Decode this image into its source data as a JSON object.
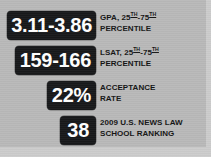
{
  "panel": {
    "background_color": "#b9b9b9",
    "badge_color": "#17181a",
    "badge_text_color": "#ffffff",
    "label_text_color": "#141414"
  },
  "stats": [
    {
      "value": "3.11-3.86",
      "label_line1_pre": "GPA, 25",
      "label_line1_sup1": "TH",
      "label_line1_mid": "-75",
      "label_line1_sup2": "TH",
      "label_line2": "PERCENTILE"
    },
    {
      "value": "159-166",
      "label_line1_pre": "LSAT, 25",
      "label_line1_sup1": "TH",
      "label_line1_mid": "-75",
      "label_line1_sup2": "TH",
      "label_line2": "PERCENTILE"
    },
    {
      "value": "22%",
      "label_line1_pre": "ACCEPTANCE",
      "label_line2": "RATE"
    },
    {
      "value": "38",
      "label_line1_pre": "2009 U.S. NEWS LAW",
      "label_line2": "SCHOOL RANKING"
    }
  ]
}
